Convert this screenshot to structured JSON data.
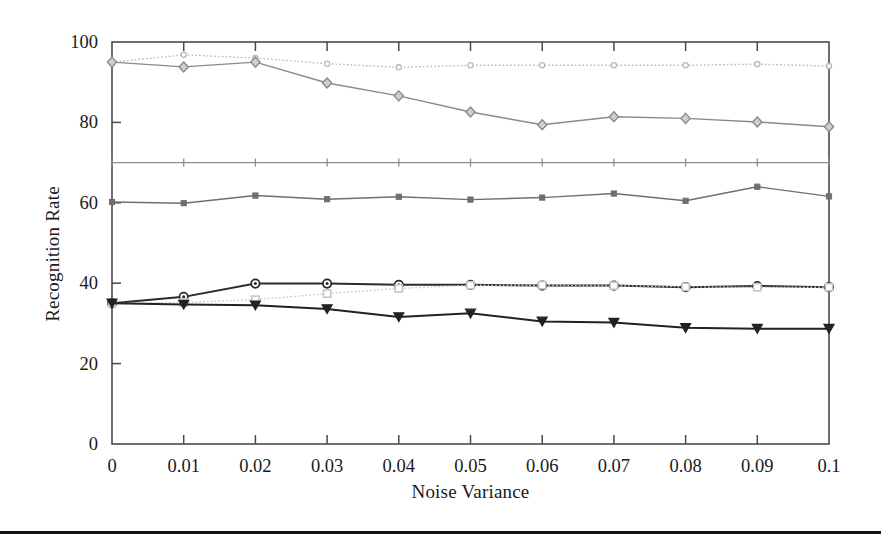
{
  "chart_data": {
    "type": "line",
    "title": "",
    "xlabel": "Noise Variance",
    "ylabel": "Recognition Rate",
    "x": [
      0,
      0.01,
      0.02,
      0.03,
      0.04,
      0.05,
      0.06,
      0.07,
      0.08,
      0.09,
      0.1
    ],
    "xtick_labels": [
      "0",
      "0.01",
      "0.02",
      "0.03",
      "0.04",
      "0.05",
      "0.06",
      "0.07",
      "0.08",
      "0.09",
      "0.1"
    ],
    "ytick_labels": [
      "0",
      "20",
      "40",
      "60",
      "80",
      "100"
    ],
    "ytick_values": [
      0,
      20,
      40,
      60,
      80,
      100
    ],
    "xlim": [
      0,
      0.1
    ],
    "ylim": [
      0,
      100
    ],
    "grid": false,
    "legend": "none",
    "series": [
      {
        "name": "series-1-top-flat",
        "marker": "circle-small",
        "linestyle": "dotted",
        "color": "#b9b9b9",
        "values": [
          95.0,
          96.8,
          96.0,
          94.6,
          93.7,
          94.2,
          94.2,
          94.2,
          94.2,
          94.5,
          94.0
        ]
      },
      {
        "name": "series-2-declining-diamond",
        "marker": "diamond",
        "linestyle": "solid",
        "color": "#8a8a8a",
        "values": [
          95.0,
          93.8,
          95.0,
          89.8,
          86.6,
          82.6,
          79.4,
          81.4,
          81.0,
          80.1,
          78.9
        ]
      },
      {
        "name": "series-3-flat-70",
        "marker": "plus",
        "linestyle": "solid",
        "color": "#8e8e8e",
        "values": [
          70.0,
          70.0,
          70.0,
          70.0,
          70.0,
          70.0,
          70.0,
          70.0,
          70.0,
          70.0,
          70.0
        ]
      },
      {
        "name": "series-4-mid-60",
        "marker": "square-small",
        "linestyle": "solid",
        "color": "#6f6f6f",
        "values": [
          60.2,
          59.9,
          61.8,
          60.9,
          61.5,
          60.8,
          61.3,
          62.3,
          60.5,
          64.0,
          61.6
        ]
      },
      {
        "name": "series-5-circle-dark",
        "marker": "circle",
        "linestyle": "solid",
        "color": "#2b2b2b",
        "values": [
          35.0,
          36.6,
          39.9,
          39.9,
          39.6,
          39.6,
          39.4,
          39.4,
          39.0,
          39.3,
          39.0
        ]
      },
      {
        "name": "series-6-square-light",
        "marker": "square-open",
        "linestyle": "dotted",
        "color": "#c6c6c6",
        "values": [
          35.0,
          35.2,
          35.9,
          37.4,
          38.7,
          39.5,
          39.5,
          39.4,
          39.1,
          39.0,
          39.0
        ]
      },
      {
        "name": "series-7-triangle-down-dark",
        "marker": "triangle-down",
        "linestyle": "solid",
        "color": "#222222",
        "values": [
          35.0,
          34.7,
          34.5,
          33.6,
          31.6,
          32.5,
          30.5,
          30.2,
          28.9,
          28.7,
          28.7
        ]
      }
    ]
  },
  "axes": {
    "frame_color": "#4a4a4a",
    "tick_color": "#4a4a4a"
  }
}
